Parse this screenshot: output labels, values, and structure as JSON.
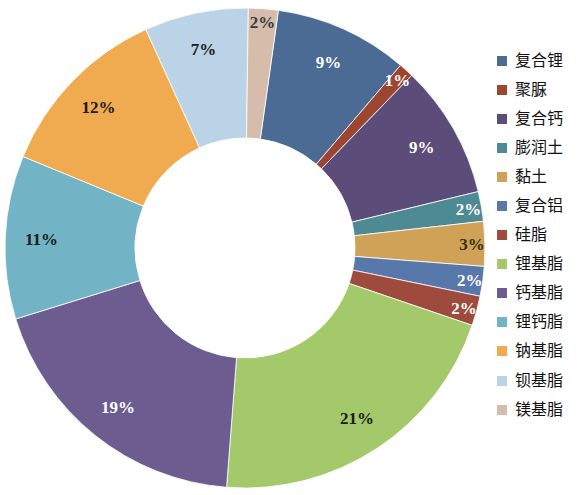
{
  "chart_data": {
    "type": "pie",
    "variant": "donut",
    "title": "",
    "subtitle": "",
    "xlabel": "",
    "ylabel": "",
    "legend_position": "right",
    "grid": false,
    "value_suffix": "%",
    "start_angle_deg": -82,
    "direction": "clockwise",
    "inner_radius_ratio": 0.46,
    "categories": [
      "复合锂",
      "聚脲",
      "复合钙",
      "膨润土",
      "黏土",
      "复合铝",
      "硅脂",
      "锂基脂",
      "钙基脂",
      "锂钙脂",
      "钠基脂",
      "钡基脂",
      "镁基脂"
    ],
    "values": [
      9,
      1,
      9,
      2,
      3,
      2,
      2,
      21,
      19,
      11,
      12,
      7,
      2
    ],
    "labels": [
      "9%",
      "1%",
      "9%",
      "2%",
      "3%",
      "2%",
      "2%",
      "21%",
      "19%",
      "11%",
      "12%",
      "7%",
      "2%"
    ],
    "colors": [
      "#4b6b94",
      "#9c4632",
      "#5b4c79",
      "#4e8a93",
      "#cfa257",
      "#5878ab",
      "#9e4a3c",
      "#a4c96a",
      "#6c5c8f",
      "#72b4c6",
      "#f0ab51",
      "#bad3e6",
      "#d6bcab"
    ],
    "label_colors": [
      "#ffffff",
      "#ffffff",
      "#ffffff",
      "#ffffff",
      "#3a2f12",
      "#ffffff",
      "#ffffff",
      "#1c1c1c",
      "#ffffff",
      "#1c1c1c",
      "#1c1c1c",
      "#1c1c1c",
      "#3a3a3a"
    ],
    "total": 100
  },
  "legend": {
    "items": [
      {
        "label": "复合锂",
        "color": "#4b6b94"
      },
      {
        "label": "聚脲",
        "color": "#9c4632"
      },
      {
        "label": "复合钙",
        "color": "#5b4c79"
      },
      {
        "label": "膨润土",
        "color": "#4e8a93"
      },
      {
        "label": "黏土",
        "color": "#cfa257"
      },
      {
        "label": "复合铝",
        "color": "#5878ab"
      },
      {
        "label": "硅脂",
        "color": "#9e4a3c"
      },
      {
        "label": "锂基脂",
        "color": "#a4c96a"
      },
      {
        "label": "钙基脂",
        "color": "#6c5c8f"
      },
      {
        "label": "锂钙脂",
        "color": "#72b4c6"
      },
      {
        "label": "钠基脂",
        "color": "#f0ab51"
      },
      {
        "label": "钡基脂",
        "color": "#bad3e6"
      },
      {
        "label": "镁基脂",
        "color": "#d6bcab"
      }
    ]
  },
  "canvas": {
    "background": "#ffffff",
    "center_x": 245,
    "center_y": 248,
    "outer_radius": 240,
    "inner_radius": 110
  }
}
